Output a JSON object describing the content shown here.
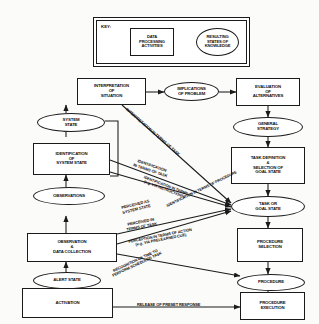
{
  "figure": {
    "type": "flowchart-diagram",
    "legend": {
      "title": "KEY:",
      "process_shape_label": "DATA\nPROCESSING\nACTIVITIES",
      "state_shape_label": "RESULTING\nSTATES OF\nKNOWLEDGE"
    }
  },
  "nodes": [
    {
      "id": "interpretation",
      "label": "INTERPRETATION\nOF\nSITUATION",
      "shape": "box"
    },
    {
      "id": "implications",
      "label": "IMPLICATIONS\nOF PROBLEM",
      "shape": "ellipse"
    },
    {
      "id": "evaluation",
      "label": "EVALUATION\nOF\nALTERNATIVES",
      "shape": "box"
    },
    {
      "id": "system_state",
      "label": "SYSTEM\nSTATE",
      "shape": "ellipse"
    },
    {
      "id": "general_strategy",
      "label": "GENERAL\nSTRATEGY",
      "shape": "ellipse"
    },
    {
      "id": "identification",
      "label": "IDENTIFICATION\nOF\nSYSTEM STATE",
      "shape": "box"
    },
    {
      "id": "task_definition",
      "label": "TASK DEFINITION\n&\nSELECTION OF\nGOAL STATE",
      "shape": "box"
    },
    {
      "id": "observations",
      "label": "OBSERVATIONS",
      "shape": "ellipse"
    },
    {
      "id": "task_or_goal_state",
      "label": "TASK OR\nGOAL STATE",
      "shape": "ellipse"
    },
    {
      "id": "observation_data",
      "label": "OBSERVATION\n&\nDATA COLLECTION",
      "shape": "box"
    },
    {
      "id": "procedure_selection",
      "label": "PROCEDURE\nSELECTION",
      "shape": "box"
    },
    {
      "id": "alert_state",
      "label": "ALERT STATE",
      "shape": "ellipse"
    },
    {
      "id": "procedure",
      "label": "PROCEDURE",
      "shape": "ellipse"
    },
    {
      "id": "activation",
      "label": "ACTIVATION",
      "shape": "box"
    },
    {
      "id": "procedure_execution",
      "label": "PROCEDURE\nEXECUTION",
      "shape": "box"
    }
  ],
  "edge_labels": [
    {
      "id": "interp_task",
      "text": "INTERPRETATION IN TERMS OF TASK"
    },
    {
      "id": "ident_task",
      "text": "IDENTIFICATION\nIN TERMS  OF TASK"
    },
    {
      "id": "ident_instruction",
      "text": "IDENTIFICATION IN TERMS\n(e.g. VIA INSTRUCTIONS)"
    },
    {
      "id": "ident_procedure",
      "text": "IDENTIFICATION IN TERMS OF PROCEDURE"
    },
    {
      "id": "perceived_system",
      "text": "PERCEIVED AS\nSYSTEM STATE"
    },
    {
      "id": "perceived_task",
      "text": "PERCEIVED IN\nTERMS OF TASK"
    },
    {
      "id": "perception_action",
      "text": "PERCEPTION IN TERMS OF ACTION\n(e.g. VIA PRELEARNED CUE)"
    },
    {
      "id": "recognition_time",
      "text": "RECOGNITION OF TIME TO\nPERFORM SCHEDULED TASK"
    },
    {
      "id": "release_preset",
      "text": "RELEASE OF PRESET RESPONSE"
    }
  ],
  "colors": {
    "stroke": "#1a1a1a",
    "text": "#111111",
    "background": "#fbfbfa",
    "node_fill": "#ffffff"
  }
}
